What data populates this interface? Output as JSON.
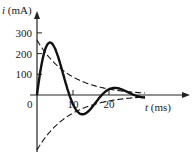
{
  "chart_data": {
    "type": "line",
    "title": "",
    "xlabel": "t (ms)",
    "ylabel": "i (mA)",
    "xlabel_italic_var": "t",
    "xlabel_unit": " (ms)",
    "ylabel_italic_var": "i",
    "ylabel_unit": " (mA)",
    "xlim": [
      0,
      40
    ],
    "ylim": [
      -270,
      320
    ],
    "x_ticks": [
      10,
      20
    ],
    "x_tick_labels": [
      "10",
      "20"
    ],
    "origin_label": "0",
    "y_ticks": [
      100,
      200,
      300
    ],
    "y_tick_labels": [
      "100",
      "200",
      "300"
    ],
    "grid": false,
    "series": [
      {
        "name": "response",
        "style": "solid",
        "description": "damped oscillation i(t) = A e^{-t/tau} sin(w t)",
        "amplitude": 265,
        "tau_ms": 9,
        "period_ms": 18,
        "t_range": [
          0,
          30
        ]
      },
      {
        "name": "upper-envelope",
        "style": "dashed",
        "amplitude": 265,
        "tau_ms": 9,
        "t_range": [
          0,
          30
        ]
      },
      {
        "name": "lower-envelope",
        "style": "dashed",
        "amplitude": -265,
        "tau_ms": 9,
        "t_range": [
          0,
          30
        ]
      }
    ]
  }
}
